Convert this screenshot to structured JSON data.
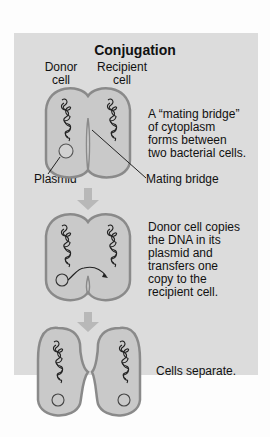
{
  "figure": {
    "title": "Conjugation",
    "labels": {
      "donor_cell": [
        "Donor",
        "cell"
      ],
      "recipient_cell": [
        "Recipient",
        "cell"
      ],
      "plasmid": "Plasmid",
      "mating_bridge": "Mating bridge"
    },
    "steps": [
      {
        "caption": [
          "A “mating bridge”",
          "of cytoplasm",
          "forms between",
          "two bacterial cells."
        ]
      },
      {
        "caption": [
          "Donor cell copies",
          "the DNA in its",
          "plasmid and",
          "transfers one",
          "copy to the",
          "recipient cell."
        ]
      },
      {
        "caption": [
          "Cells separate."
        ]
      }
    ],
    "colors": {
      "panel": "#dcdcdc",
      "cell_fill": "#c9c9c9",
      "cell_outline": "#8a8a8a",
      "arrow": "#b8b8b8",
      "text": "#111111"
    }
  }
}
